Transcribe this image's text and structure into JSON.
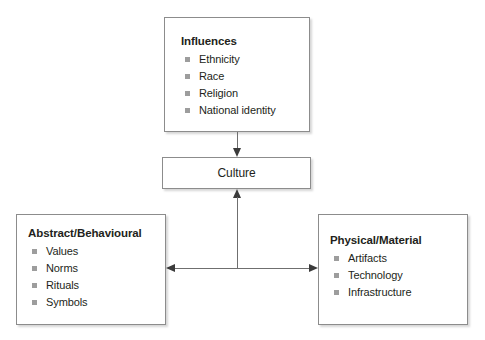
{
  "diagram": {
    "nodes": {
      "influences": {
        "title": "Influences",
        "items": [
          "Ethnicity",
          "Race",
          "Religion",
          "National identity"
        ]
      },
      "culture": {
        "label": "Culture"
      },
      "abstract": {
        "title": "Abstract/Behavioural",
        "items": [
          "Values",
          "Norms",
          "Rituals",
          "Symbols"
        ]
      },
      "physical": {
        "title": "Physical/Material",
        "items": [
          "Artifacts",
          "Technology",
          "Infrastructure"
        ]
      }
    },
    "connectors": [
      {
        "name": "influences-to-culture",
        "direction": "down"
      },
      {
        "name": "components-to-culture",
        "direction": "up"
      },
      {
        "name": "abstract-physical",
        "direction": "both"
      }
    ],
    "colors": {
      "text": "#231f20",
      "border": "#8c8c8c",
      "bullet": "#9d9d9d",
      "connector": "#6f6f6f",
      "arrowhead": "#3b3b3b",
      "background": "#ffffff"
    }
  }
}
